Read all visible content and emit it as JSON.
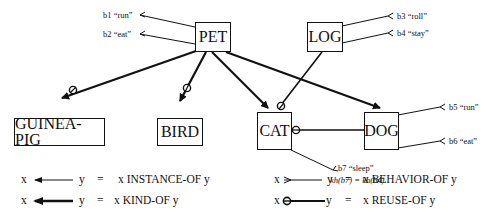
{
  "nodes": {
    "pet": "PET",
    "log": "LOG",
    "guinea_pig": "GUINEA-PIG",
    "bird": "BIRD",
    "cat": "CAT",
    "dog": "DOG"
  },
  "behaviors": {
    "b1": "b1  “run”",
    "b2": "b2  “eat”",
    "b3": "b3  “roll”",
    "b4": "b4  “stay”",
    "b5": "b5  “run”",
    "b6": "b6  “eat”",
    "b7": "b7  “sleep”"
  },
  "note": "kh(b7) = kh(b4)",
  "legend": [
    {
      "x": "x",
      "y": "y",
      "eq": "=",
      "meaning": "x INSTANCE-OF y",
      "symbol": "thin-arrow"
    },
    {
      "x": "x",
      "y": "y",
      "eq": "=",
      "meaning": "x KIND-OF y",
      "symbol": "thick-arrow"
    },
    {
      "x": "x",
      "y": "y",
      "eq": "=",
      "meaning": "x BEHAVIOR-OF y",
      "symbol": "chevron-line"
    },
    {
      "x": "x",
      "y": "y",
      "eq": "=",
      "meaning": "x REUSE-OF y",
      "symbol": "circle-line"
    }
  ]
}
